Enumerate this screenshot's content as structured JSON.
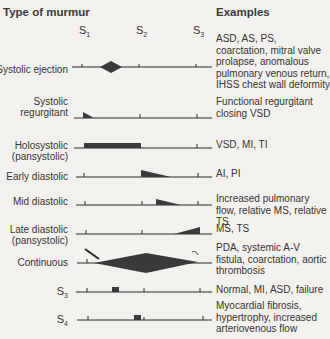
{
  "headers": {
    "type_of_murmur": "Type of murmur",
    "examples": "Examples"
  },
  "sounds": [
    {
      "label": "S",
      "sub": "1"
    },
    {
      "label": "S",
      "sub": "2"
    },
    {
      "label": "S",
      "sub": "3"
    }
  ],
  "rows": [
    {
      "label_lines": [
        "Systolic ejection"
      ],
      "examples": "ASD, AS, PS, coarctation, mitral valve prolapse, anomalous pulmonary venous return, IHSS chest wall deformity",
      "shape": "diamond-systolic"
    },
    {
      "label_lines": [
        "Systolic",
        "regurgitant"
      ],
      "examples": "Functional regurgitant closing VSD",
      "shape": "early-systolic-decrescendo"
    },
    {
      "label_lines": [
        "Holosystolic",
        "(pansystolic)"
      ],
      "examples": "VSD, MI, TI",
      "shape": "holosystolic-block"
    },
    {
      "label_lines": [
        "Early diastolic"
      ],
      "examples": "AI, PI",
      "shape": "early-diastolic-decrescendo"
    },
    {
      "label_lines": [
        "Mid diastolic"
      ],
      "examples": "Increased pulmonary flow, relative MS, relative TS",
      "shape": "mid-diastolic-decrescendo"
    },
    {
      "label_lines": [
        "Late diastolic",
        "(pansystolic)"
      ],
      "examples": "MS, TS",
      "shape": "late-diastolic-crescendo"
    },
    {
      "label_lines": [
        "Continuous"
      ],
      "examples": "PDA, systemic A-V fistula, coarctation, aortic thrombosis",
      "shape": "continuous-diamond"
    },
    {
      "label_lines": [
        "S3"
      ],
      "examples": "Normal, MI, ASD, failure",
      "shape": "s3-block"
    },
    {
      "label_lines": [
        "S4"
      ],
      "examples": "Myocardial fibrosis, hypertrophy, increased arteriovenous flow",
      "shape": "s4-block"
    }
  ],
  "row_labels": {
    "r0": "Systolic ejection",
    "r1a": "Systolic",
    "r1b": "regurgitant",
    "r2a": "Holosystolic",
    "r2b": "(pansystolic)",
    "r3": "Early diastolic",
    "r4": "Mid diastolic",
    "r5a": "Late diastolic",
    "r5b": "(pansystolic)",
    "r6": "Continuous",
    "r7s": "S",
    "r7sub": "3",
    "r8s": "S",
    "r8sub": "4"
  },
  "colors": {
    "background": "#f3f1ee",
    "ink": "#2a2a2a",
    "fill": "#3a3a3a"
  }
}
